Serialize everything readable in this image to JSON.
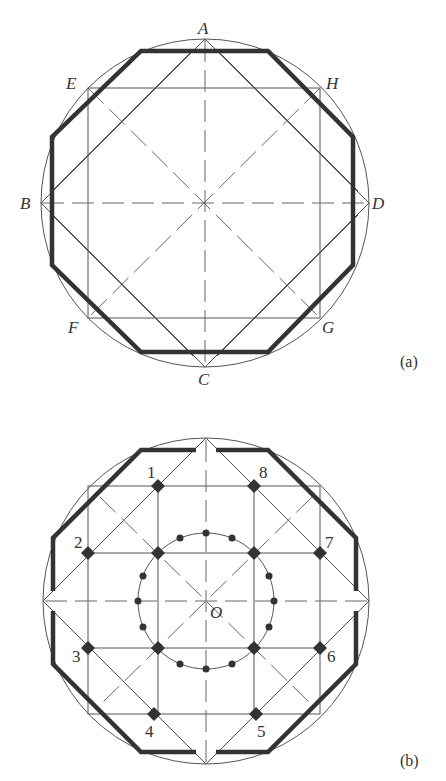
{
  "figure_a": {
    "caption": "(a)",
    "points": {
      "A": "A",
      "B": "B",
      "C": "C",
      "D": "D",
      "E": "E",
      "F": "F",
      "G": "G",
      "H": "H"
    }
  },
  "figure_b": {
    "caption": "(b)",
    "center_label": "O",
    "numbers": [
      "1",
      "2",
      "3",
      "4",
      "5",
      "6",
      "7",
      "8"
    ]
  },
  "colors": {
    "line": "#555555",
    "thick": "#333333",
    "background": "#ffffff"
  }
}
